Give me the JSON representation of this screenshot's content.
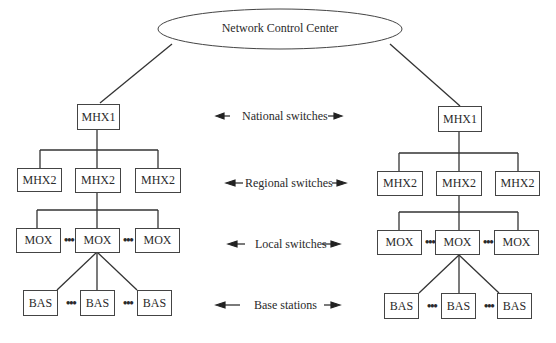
{
  "root": {
    "label": "Network Control Center"
  },
  "levels": [
    {
      "label": "National switches"
    },
    {
      "label": "Regional switches"
    },
    {
      "label": "Local switches"
    },
    {
      "label": "Base stations"
    }
  ],
  "left_tree": {
    "national": "MHX1",
    "regional": [
      "MHX2",
      "MHX2",
      "MHX2"
    ],
    "local": [
      "MOX",
      "MOX",
      "MOX"
    ],
    "base": [
      "BAS",
      "BAS",
      "BAS"
    ]
  },
  "right_tree": {
    "national": "MHX1",
    "regional": [
      "MHX2",
      "MHX2",
      "MHX2"
    ],
    "local": [
      "MOX",
      "MOX",
      "MOX"
    ],
    "base": [
      "BAS",
      "BAS",
      "BAS"
    ]
  },
  "ellipsis": "•••"
}
